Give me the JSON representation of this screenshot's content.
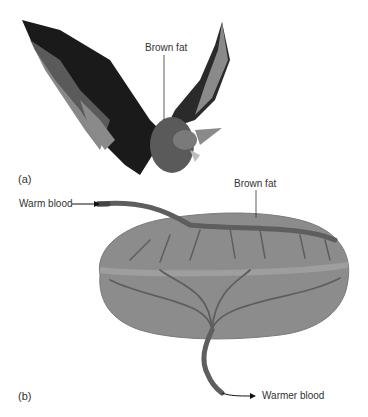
{
  "panel_a": {
    "label": "(a)",
    "callout": "Brown fat",
    "subject": "bat-in-flight"
  },
  "panel_b": {
    "label": "(b)",
    "callout": "Brown fat",
    "inflow": "Warm blood",
    "outflow": "Warmer blood"
  },
  "colors": {
    "bat_dark": "#1a1a1a",
    "bat_mid": "#5a5a5a",
    "bat_light": "#8a8a8a",
    "fat_fill": "#8c8c8c",
    "fat_band": "#9a9a9a",
    "vessel": "#5e5e5e"
  }
}
